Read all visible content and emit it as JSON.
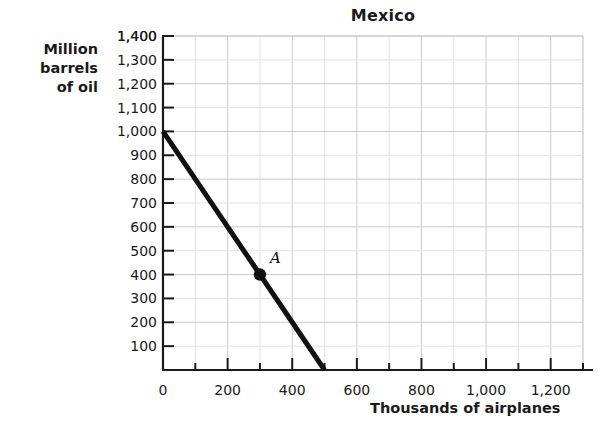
{
  "chart_data": {
    "type": "line",
    "title": "Mexico",
    "xlabel": "Thousands of airplanes",
    "ylabel": "Million barrels of oil",
    "ylabel_lines": [
      "Million",
      "barrels",
      "of oil"
    ],
    "xlim": [
      0,
      1300
    ],
    "ylim": [
      0,
      1400
    ],
    "grid": true,
    "legend": "none",
    "xticks": [
      0,
      200,
      400,
      600,
      800,
      1000,
      1200
    ],
    "xtick_labels": [
      "0",
      "200",
      "400",
      "600",
      "800",
      "1,000",
      "1,200"
    ],
    "xminor_step": 100,
    "yticks": [
      100,
      200,
      300,
      400,
      500,
      600,
      700,
      800,
      900,
      1000,
      1100,
      1200,
      1300,
      1400
    ],
    "ytick_labels": [
      "100",
      "200",
      "300",
      "400",
      "500",
      "600",
      "700",
      "800",
      "900",
      "1,000",
      "1,100",
      "1,200",
      "1,300",
      "1,400"
    ],
    "series": [
      {
        "name": "Production possibilities frontier",
        "x": [
          0,
          500
        ],
        "values": [
          1000,
          0
        ],
        "color": "#111111",
        "linewidth": 5
      }
    ],
    "annotations": [
      {
        "label": "A",
        "x": 300,
        "y": 400,
        "marker": "filled-circle",
        "marker_color": "#111111"
      }
    ]
  },
  "figure": {
    "background_color": "#ffffff",
    "axis_color": "#1a1a1a",
    "grid_color": "#c9c9c9",
    "minor_grid_color": "#e2e2e2"
  }
}
